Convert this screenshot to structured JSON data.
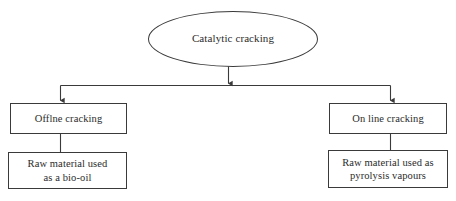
{
  "diagram": {
    "type": "flowchart",
    "orientation": "top-down",
    "background_color": "#ffffff",
    "line_color": "#3a3a3a",
    "text_color": "#2b2b2b",
    "nodes": {
      "root": {
        "label": "Catalytic cracking",
        "shape": "ellipse"
      },
      "offline": {
        "label": "Offlne cracking",
        "shape": "rectangle"
      },
      "online": {
        "label": "On line cracking",
        "shape": "rectangle"
      },
      "bio_oil": {
        "label": "Raw material used\nas a bio-oil",
        "shape": "rectangle"
      },
      "vapours": {
        "label": "Raw material used as\npyrolysis  vapours",
        "shape": "rectangle"
      }
    },
    "edges": [
      {
        "from": "root",
        "to": "split",
        "arrowhead": true
      },
      {
        "from": "split",
        "to": "offline",
        "arrowhead": true
      },
      {
        "from": "split",
        "to": "online",
        "arrowhead": true
      },
      {
        "from": "offline",
        "to": "bio_oil",
        "arrowhead": false
      },
      {
        "from": "online",
        "to": "vapours",
        "arrowhead": false
      }
    ]
  }
}
